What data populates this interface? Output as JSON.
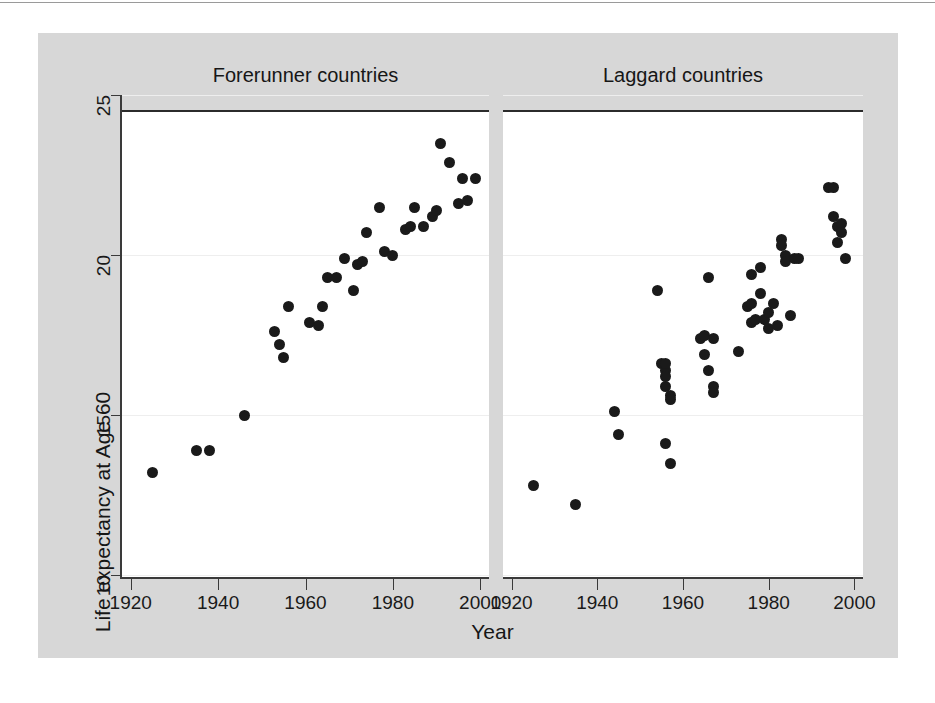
{
  "figure": {
    "background_color": "#d7d7d7",
    "panel_color": "#ffffff",
    "marker_color": "#1a1a1a",
    "gridline_color": "#eeeeee",
    "axis_color": "#3a3a3a"
  },
  "chart_data": {
    "type": "scatter",
    "title": "",
    "xlabel": "Year",
    "ylabel": "Life expectancy at Age 60",
    "xlim": [
      1918,
      2002
    ],
    "ylim": [
      10,
      25
    ],
    "xticks": [
      1920,
      1940,
      1960,
      1980,
      2000
    ],
    "xtick_labels": [
      "1920",
      "1940",
      "1960",
      "1980",
      "2000"
    ],
    "yticks": [
      10,
      15,
      20,
      25
    ],
    "ytick_labels": [
      "10",
      "15",
      "20",
      "25"
    ],
    "grid": true,
    "grid_axis": "y",
    "legend": "none",
    "panels": [
      {
        "name": "forerunner",
        "title": "Forerunner countries",
        "points": [
          {
            "x": 1925,
            "y": 13.2
          },
          {
            "x": 1935,
            "y": 13.9
          },
          {
            "x": 1938,
            "y": 13.9
          },
          {
            "x": 1946,
            "y": 15.0
          },
          {
            "x": 1953,
            "y": 17.6
          },
          {
            "x": 1954,
            "y": 17.2
          },
          {
            "x": 1955,
            "y": 16.8
          },
          {
            "x": 1956,
            "y": 18.4
          },
          {
            "x": 1961,
            "y": 17.9
          },
          {
            "x": 1963,
            "y": 17.8
          },
          {
            "x": 1964,
            "y": 18.4
          },
          {
            "x": 1965,
            "y": 19.3
          },
          {
            "x": 1967,
            "y": 19.3
          },
          {
            "x": 1969,
            "y": 19.9
          },
          {
            "x": 1971,
            "y": 18.9
          },
          {
            "x": 1972,
            "y": 19.7
          },
          {
            "x": 1973,
            "y": 19.8
          },
          {
            "x": 1974,
            "y": 20.7
          },
          {
            "x": 1977,
            "y": 21.5
          },
          {
            "x": 1978,
            "y": 20.1
          },
          {
            "x": 1980,
            "y": 20.0
          },
          {
            "x": 1983,
            "y": 20.8
          },
          {
            "x": 1984,
            "y": 20.9
          },
          {
            "x": 1985,
            "y": 21.5
          },
          {
            "x": 1987,
            "y": 20.9
          },
          {
            "x": 1989,
            "y": 21.2
          },
          {
            "x": 1990,
            "y": 21.4
          },
          {
            "x": 1991,
            "y": 23.5
          },
          {
            "x": 1993,
            "y": 22.9
          },
          {
            "x": 1995,
            "y": 21.6
          },
          {
            "x": 1996,
            "y": 22.4
          },
          {
            "x": 1997,
            "y": 21.7
          },
          {
            "x": 1999,
            "y": 22.4
          }
        ]
      },
      {
        "name": "laggard",
        "title": "Laggard countries",
        "points": [
          {
            "x": 1925,
            "y": 12.8
          },
          {
            "x": 1935,
            "y": 12.2
          },
          {
            "x": 1944,
            "y": 15.1
          },
          {
            "x": 1945,
            "y": 14.4
          },
          {
            "x": 1954,
            "y": 18.9
          },
          {
            "x": 1955,
            "y": 16.6
          },
          {
            "x": 1956,
            "y": 16.4
          },
          {
            "x": 1956,
            "y": 16.2
          },
          {
            "x": 1956,
            "y": 16.6
          },
          {
            "x": 1956,
            "y": 15.9
          },
          {
            "x": 1957,
            "y": 15.6
          },
          {
            "x": 1957,
            "y": 15.5
          },
          {
            "x": 1956,
            "y": 14.1
          },
          {
            "x": 1957,
            "y": 13.5
          },
          {
            "x": 1964,
            "y": 17.4
          },
          {
            "x": 1965,
            "y": 17.5
          },
          {
            "x": 1965,
            "y": 16.9
          },
          {
            "x": 1966,
            "y": 16.4
          },
          {
            "x": 1966,
            "y": 19.3
          },
          {
            "x": 1967,
            "y": 17.4
          },
          {
            "x": 1967,
            "y": 15.9
          },
          {
            "x": 1967,
            "y": 15.7
          },
          {
            "x": 1973,
            "y": 17.0
          },
          {
            "x": 1975,
            "y": 18.4
          },
          {
            "x": 1976,
            "y": 19.4
          },
          {
            "x": 1976,
            "y": 18.5
          },
          {
            "x": 1976,
            "y": 17.9
          },
          {
            "x": 1977,
            "y": 18.0
          },
          {
            "x": 1978,
            "y": 19.6
          },
          {
            "x": 1978,
            "y": 18.8
          },
          {
            "x": 1979,
            "y": 18.0
          },
          {
            "x": 1980,
            "y": 18.2
          },
          {
            "x": 1980,
            "y": 17.7
          },
          {
            "x": 1981,
            "y": 18.5
          },
          {
            "x": 1982,
            "y": 17.8
          },
          {
            "x": 1983,
            "y": 20.5
          },
          {
            "x": 1983,
            "y": 20.3
          },
          {
            "x": 1984,
            "y": 20.0
          },
          {
            "x": 1984,
            "y": 19.8
          },
          {
            "x": 1985,
            "y": 18.1
          },
          {
            "x": 1986,
            "y": 19.9
          },
          {
            "x": 1987,
            "y": 19.9
          },
          {
            "x": 1994,
            "y": 22.1
          },
          {
            "x": 1995,
            "y": 22.1
          },
          {
            "x": 1995,
            "y": 21.2
          },
          {
            "x": 1996,
            "y": 20.9
          },
          {
            "x": 1996,
            "y": 20.4
          },
          {
            "x": 1997,
            "y": 21.0
          },
          {
            "x": 1997,
            "y": 20.7
          },
          {
            "x": 1998,
            "y": 19.9
          }
        ]
      }
    ]
  }
}
